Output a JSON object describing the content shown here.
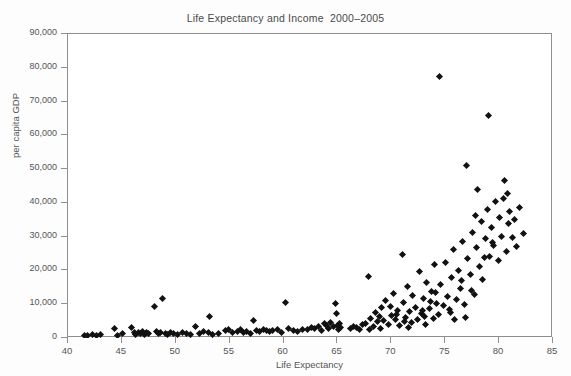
{
  "chart_data": {
    "type": "scatter",
    "title": "Life Expectancy and Income  2000–2005",
    "xlabel": "Life Expectancy",
    "ylabel": "per capita GDP",
    "xlim": [
      40,
      85
    ],
    "ylim": [
      0,
      90000
    ],
    "xticks": [
      40,
      45,
      50,
      55,
      60,
      65,
      70,
      75,
      80,
      85
    ],
    "xtick_labels": [
      "40",
      "45",
      "50",
      "55",
      "60",
      "65",
      "70",
      "75",
      "80",
      "85"
    ],
    "yticks": [
      0,
      10000,
      20000,
      30000,
      40000,
      50000,
      60000,
      70000,
      80000,
      90000
    ],
    "ytick_labels": [
      "0",
      "10,000",
      "20,000",
      "30,000",
      "40,000",
      "50,000",
      "60,000",
      "70,000",
      "80,000",
      "90,000"
    ],
    "grid": false,
    "legend": null,
    "marker": "diamond",
    "marker_color": "#111111",
    "frame_color": "#8f8f8f",
    "background_color": "#ffffff",
    "series": [
      {
        "name": "Countries",
        "points": [
          [
            41.5,
            600
          ],
          [
            41.8,
            700
          ],
          [
            42.3,
            900
          ],
          [
            42.6,
            800
          ],
          [
            43.0,
            1100
          ],
          [
            44.3,
            2800
          ],
          [
            44.6,
            700
          ],
          [
            45.1,
            1200
          ],
          [
            45.9,
            3100
          ],
          [
            46.2,
            1500
          ],
          [
            46.3,
            900
          ],
          [
            46.5,
            1700
          ],
          [
            46.7,
            1400
          ],
          [
            46.9,
            1900
          ],
          [
            47.1,
            1100
          ],
          [
            47.3,
            1600
          ],
          [
            47.5,
            1300
          ],
          [
            48.0,
            9300
          ],
          [
            48.2,
            1800
          ],
          [
            48.4,
            1200
          ],
          [
            48.6,
            1500
          ],
          [
            48.8,
            11800
          ],
          [
            49.0,
            1400
          ],
          [
            49.2,
            900
          ],
          [
            49.5,
            1700
          ],
          [
            49.8,
            1300
          ],
          [
            50.2,
            1000
          ],
          [
            50.6,
            1500
          ],
          [
            51.0,
            1200
          ],
          [
            51.4,
            900
          ],
          [
            51.8,
            3300
          ],
          [
            52.2,
            1400
          ],
          [
            52.6,
            1900
          ],
          [
            53.0,
            1600
          ],
          [
            53.1,
            6400
          ],
          [
            53.4,
            1100
          ],
          [
            54.0,
            1300
          ],
          [
            54.6,
            2100
          ],
          [
            54.9,
            2600
          ],
          [
            55.3,
            1500
          ],
          [
            55.7,
            1800
          ],
          [
            56.0,
            2400
          ],
          [
            56.3,
            1700
          ],
          [
            56.6,
            2000
          ],
          [
            56.9,
            1400
          ],
          [
            57.2,
            5100
          ],
          [
            57.5,
            2200
          ],
          [
            57.8,
            1900
          ],
          [
            58.1,
            2600
          ],
          [
            58.4,
            2300
          ],
          [
            58.7,
            1800
          ],
          [
            59.0,
            2100
          ],
          [
            59.4,
            2500
          ],
          [
            59.8,
            1700
          ],
          [
            60.2,
            10600
          ],
          [
            60.5,
            2800
          ],
          [
            60.9,
            2300
          ],
          [
            61.3,
            2000
          ],
          [
            61.8,
            2600
          ],
          [
            62.2,
            2400
          ],
          [
            62.6,
            3100
          ],
          [
            62.9,
            2700
          ],
          [
            63.2,
            3400
          ],
          [
            63.5,
            2200
          ],
          [
            63.8,
            4200
          ],
          [
            64.0,
            3700
          ],
          [
            64.2,
            2900
          ],
          [
            64.4,
            4600
          ],
          [
            64.6,
            3300
          ],
          [
            64.8,
            10300
          ],
          [
            64.9,
            7200
          ],
          [
            65.0,
            3800
          ],
          [
            65.1,
            2500
          ],
          [
            65.2,
            4400
          ],
          [
            65.3,
            3000
          ],
          [
            66.8,
            3100
          ],
          [
            67.0,
            2600
          ],
          [
            67.3,
            3900
          ],
          [
            67.6,
            4300
          ],
          [
            67.9,
            18300
          ],
          [
            68.1,
            5800
          ],
          [
            68.3,
            3500
          ],
          [
            68.5,
            7600
          ],
          [
            68.7,
            4900
          ],
          [
            68.9,
            6300
          ],
          [
            69.1,
            8900
          ],
          [
            69.3,
            5200
          ],
          [
            69.5,
            11200
          ],
          [
            69.7,
            4100
          ],
          [
            69.9,
            9400
          ],
          [
            70.0,
            6700
          ],
          [
            70.2,
            13100
          ],
          [
            70.4,
            5500
          ],
          [
            70.6,
            8200
          ],
          [
            70.8,
            3700
          ],
          [
            71.0,
            24800
          ],
          [
            71.1,
            10400
          ],
          [
            71.3,
            6100
          ],
          [
            71.5,
            15200
          ],
          [
            71.7,
            7800
          ],
          [
            71.9,
            4600
          ],
          [
            72.0,
            12600
          ],
          [
            72.2,
            9100
          ],
          [
            72.4,
            5400
          ],
          [
            72.6,
            19600
          ],
          [
            72.8,
            7300
          ],
          [
            73.0,
            11800
          ],
          [
            73.1,
            6500
          ],
          [
            73.3,
            16400
          ],
          [
            73.5,
            8700
          ],
          [
            73.7,
            13900
          ],
          [
            73.9,
            5900
          ],
          [
            74.0,
            21700
          ],
          [
            74.2,
            10100
          ],
          [
            74.4,
            7000
          ],
          [
            74.5,
            77500
          ],
          [
            74.6,
            15800
          ],
          [
            74.8,
            9600
          ],
          [
            75.0,
            22400
          ],
          [
            75.2,
            12300
          ],
          [
            75.4,
            8400
          ],
          [
            75.6,
            17900
          ],
          [
            75.8,
            26300
          ],
          [
            76.0,
            11400
          ],
          [
            76.2,
            20100
          ],
          [
            76.4,
            14600
          ],
          [
            76.6,
            28700
          ],
          [
            76.8,
            9900
          ],
          [
            77.0,
            51100
          ],
          [
            77.1,
            23500
          ],
          [
            77.3,
            18700
          ],
          [
            77.5,
            31200
          ],
          [
            77.7,
            12900
          ],
          [
            77.9,
            26800
          ],
          [
            78.0,
            43900
          ],
          [
            78.2,
            21300
          ],
          [
            78.4,
            34600
          ],
          [
            78.5,
            17200
          ],
          [
            78.7,
            29400
          ],
          [
            78.9,
            38100
          ],
          [
            79.0,
            66000
          ],
          [
            79.1,
            24100
          ],
          [
            79.3,
            32700
          ],
          [
            79.5,
            27500
          ],
          [
            79.7,
            40300
          ],
          [
            79.9,
            22900
          ],
          [
            80.0,
            35800
          ],
          [
            80.2,
            30100
          ],
          [
            80.4,
            41200
          ],
          [
            80.5,
            46500
          ],
          [
            80.7,
            25700
          ],
          [
            80.9,
            33900
          ],
          [
            81.0,
            37400
          ],
          [
            81.2,
            29800
          ],
          [
            81.4,
            35200
          ],
          [
            81.6,
            27100
          ],
          [
            81.9,
            38600
          ],
          [
            82.3,
            31000
          ],
          [
            66.2,
            2900
          ],
          [
            66.5,
            3400
          ],
          [
            70.5,
            6900
          ],
          [
            71.2,
            5000
          ],
          [
            72.9,
            8000
          ],
          [
            73.6,
            10800
          ],
          [
            74.1,
            13400
          ],
          [
            75.5,
            7500
          ],
          [
            76.5,
            16900
          ],
          [
            77.8,
            36200
          ],
          [
            79.4,
            28200
          ],
          [
            80.8,
            42800
          ],
          [
            73.2,
            3900
          ],
          [
            71.6,
            3200
          ],
          [
            69.0,
            2800
          ],
          [
            68.0,
            2400
          ],
          [
            75.9,
            5600
          ],
          [
            76.9,
            6200
          ],
          [
            78.6,
            23800
          ],
          [
            77.4,
            14100
          ]
        ]
      }
    ]
  }
}
